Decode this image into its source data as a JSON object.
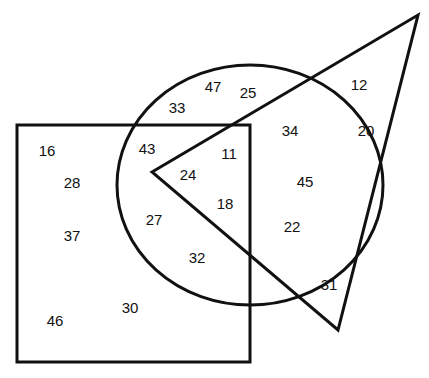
{
  "diagram": {
    "type": "venn",
    "shapes": {
      "rectangle": {
        "x": 17,
        "y": 125,
        "width": 233,
        "height": 237
      },
      "circle": {
        "cx": 250,
        "cy": 185,
        "rx": 133,
        "ry": 120
      },
      "triangle": {
        "points": "152,172 418,15 338,330"
      }
    },
    "stroke_color": "#111111",
    "numbers": [
      {
        "value": "47",
        "x": 213,
        "y": 86
      },
      {
        "value": "25",
        "x": 248,
        "y": 92
      },
      {
        "value": "33",
        "x": 177,
        "y": 107
      },
      {
        "value": "12",
        "x": 359,
        "y": 84
      },
      {
        "value": "34",
        "x": 290,
        "y": 130
      },
      {
        "value": "20",
        "x": 366,
        "y": 130
      },
      {
        "value": "16",
        "x": 47,
        "y": 150
      },
      {
        "value": "43",
        "x": 147,
        "y": 148
      },
      {
        "value": "11",
        "x": 229,
        "y": 153
      },
      {
        "value": "28",
        "x": 72,
        "y": 182
      },
      {
        "value": "24",
        "x": 188,
        "y": 174
      },
      {
        "value": "45",
        "x": 305,
        "y": 181
      },
      {
        "value": "18",
        "x": 225,
        "y": 203
      },
      {
        "value": "27",
        "x": 154,
        "y": 219
      },
      {
        "value": "22",
        "x": 292,
        "y": 226
      },
      {
        "value": "37",
        "x": 72,
        "y": 235
      },
      {
        "value": "32",
        "x": 197,
        "y": 257
      },
      {
        "value": "31",
        "x": 329,
        "y": 284
      },
      {
        "value": "30",
        "x": 130,
        "y": 307
      },
      {
        "value": "46",
        "x": 55,
        "y": 320
      }
    ]
  }
}
